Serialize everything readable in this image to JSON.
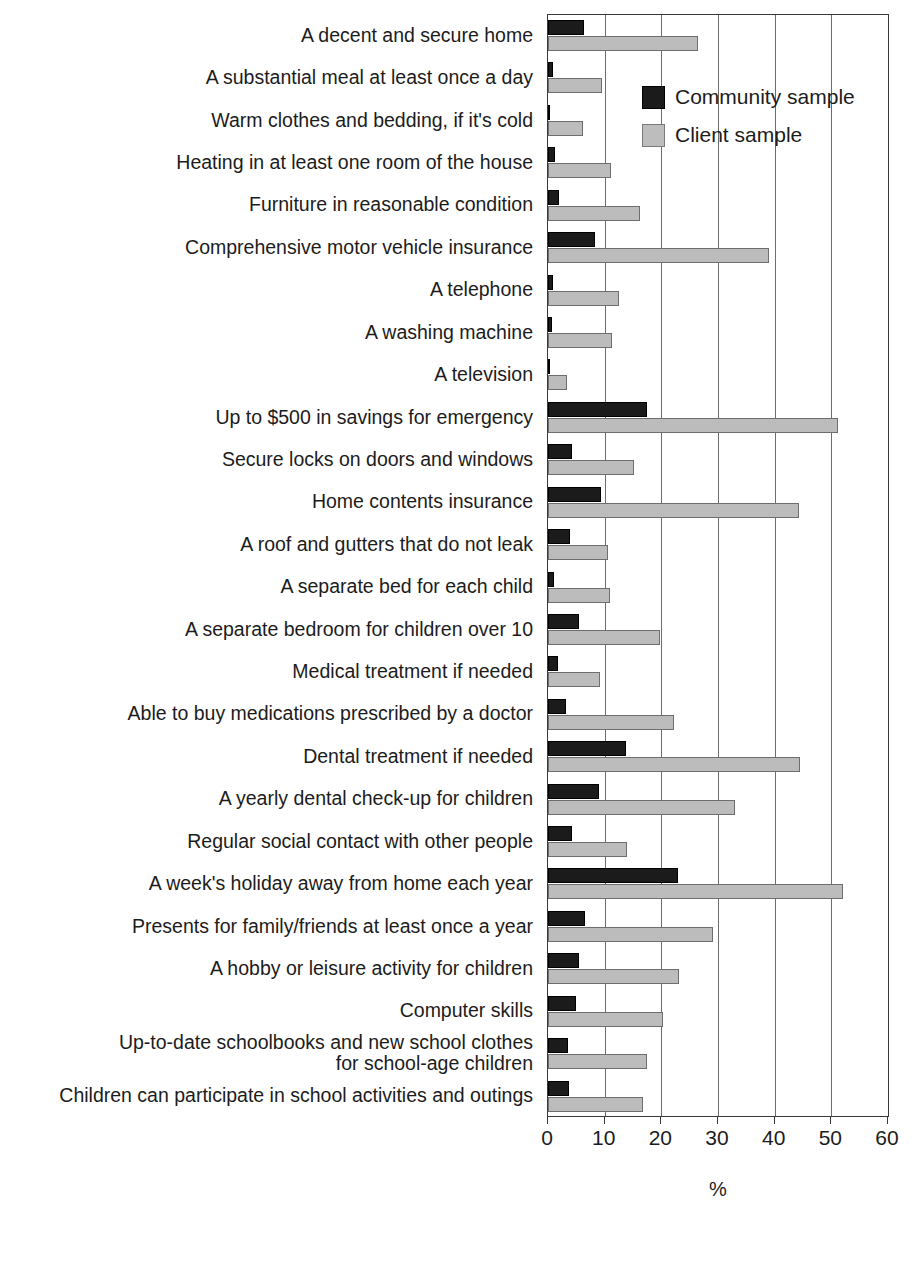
{
  "figure": {
    "title_remnant": "",
    "axis_title": "%"
  },
  "legend": {
    "position": "inside-top-right",
    "entries": [
      {
        "label": "Community sample",
        "color": "#1b1b1b",
        "swatch": "community-swatch"
      },
      {
        "label": "Client sample",
        "color": "#bdbdbd",
        "swatch": "client-swatch"
      }
    ]
  },
  "axis": {
    "ticks": [
      0,
      10,
      20,
      30,
      40,
      50,
      60
    ],
    "tick_labels": [
      "0",
      "10",
      "20",
      "30",
      "40",
      "50",
      "60"
    ],
    "label": "%",
    "min": 0,
    "max": 60
  },
  "chart_data": {
    "type": "bar",
    "orientation": "horizontal",
    "title": "",
    "xlabel": "%",
    "ylabel": "",
    "xlim": [
      0,
      60
    ],
    "grid": "vertical",
    "legend_position": "inside-top-right",
    "categories": [
      "A decent and secure home",
      "A substantial meal at least once a day",
      "Warm clothes and bedding, if it's cold",
      "Heating in at least one room of the house",
      "Furniture in reasonable condition",
      "Comprehensive motor vehicle insurance",
      "A telephone",
      "A washing machine",
      "A television",
      "Up to $500 in savings for emergency",
      "Secure locks on doors and windows",
      "Home contents insurance",
      "A roof and gutters that do not leak",
      "A separate bed for each child",
      "A separate bedroom for children over 10",
      "Medical treatment if needed",
      "Able to buy medications prescribed by a doctor",
      "Dental treatment if needed",
      "A yearly dental check-up for children",
      "Regular social contact with other people",
      "A week's holiday away from home each year",
      "Presents for family/friends at least once a year",
      "A hobby or leisure activity for children",
      "Computer skills",
      "Up-to-date schoolbooks and new school clothes\nfor school-age children",
      "Children can participate in school activities and outings"
    ],
    "series": [
      {
        "name": "Community sample",
        "color": "#1b1b1b",
        "values": [
          6.3,
          0.8,
          0.2,
          1.2,
          2.0,
          8.3,
          0.9,
          0.7,
          0.3,
          17.5,
          4.2,
          9.3,
          3.8,
          1.1,
          5.5,
          1.8,
          3.2,
          13.8,
          9.0,
          4.3,
          23.0,
          6.5,
          5.5,
          5.0,
          3.5,
          3.7
        ]
      },
      {
        "name": "Client sample",
        "color": "#bdbdbd",
        "values": [
          26.5,
          9.6,
          6.2,
          11.2,
          16.2,
          39.0,
          12.6,
          11.3,
          3.3,
          51.2,
          15.1,
          44.3,
          10.5,
          11.0,
          19.7,
          9.2,
          22.3,
          44.5,
          33.0,
          14.0,
          52.0,
          29.2,
          23.2,
          20.3,
          17.4,
          16.8
        ]
      }
    ]
  }
}
